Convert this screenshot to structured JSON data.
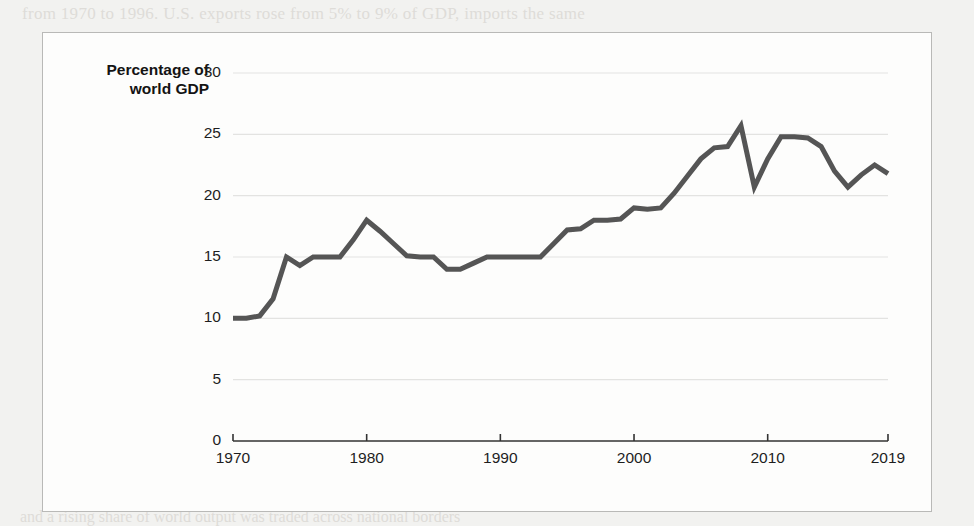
{
  "figure": {
    "background_color": "#fdfdfc",
    "border_color": "#b9b9b7",
    "page_background": "#f2f2f0"
  },
  "bleed_through": {
    "top_line": "from 1970 to 1996. U.S. exports rose from 5% to 9% of GDP, imports the same",
    "bottom_line": "and a rising share of world output was traded across national borders"
  },
  "chart_data": {
    "type": "line",
    "title": "",
    "subtitle": "",
    "xlabel": "",
    "ylabel": "Percentage of world GDP",
    "ylabel_line1": "Percentage of",
    "ylabel_line2": "world GDP",
    "xlim": [
      1970,
      2019
    ],
    "ylim": [
      0,
      30
    ],
    "ytick_values": [
      0,
      5,
      10,
      15,
      20,
      25,
      30
    ],
    "ytick_labels": [
      "0",
      "5",
      "10",
      "15",
      "20",
      "25",
      "30"
    ],
    "xtick_values": [
      1970,
      1980,
      1990,
      2000,
      2010,
      2019
    ],
    "xtick_labels": [
      "1970",
      "1980",
      "1990",
      "2000",
      "2010",
      "2019"
    ],
    "grid": true,
    "grid_axis": "y",
    "grid_color": "#e3e3e1",
    "legend": false,
    "legend_position": "none",
    "line_color": "#555555",
    "line_width": 5,
    "axis_color": "#333333",
    "series": [
      {
        "name": "Trade as percentage of world GDP",
        "x": [
          1970,
          1971,
          1972,
          1973,
          1974,
          1975,
          1976,
          1977,
          1978,
          1979,
          1980,
          1981,
          1982,
          1983,
          1984,
          1985,
          1986,
          1987,
          1988,
          1989,
          1990,
          1991,
          1992,
          1993,
          1994,
          1995,
          1996,
          1997,
          1998,
          1999,
          2000,
          2001,
          2002,
          2003,
          2004,
          2005,
          2006,
          2007,
          2008,
          2009,
          2010,
          2011,
          2012,
          2013,
          2014,
          2015,
          2016,
          2017,
          2018,
          2019
        ],
        "values": [
          10.0,
          10.0,
          10.2,
          11.6,
          15.0,
          14.3,
          15.0,
          15.0,
          15.0,
          16.4,
          18.0,
          17.1,
          16.1,
          15.1,
          15.0,
          15.0,
          14.0,
          14.0,
          14.5,
          15.0,
          15.0,
          15.0,
          15.0,
          15.0,
          16.1,
          17.2,
          17.3,
          18.0,
          18.0,
          18.1,
          19.0,
          18.9,
          19.0,
          20.2,
          21.6,
          23.0,
          23.9,
          24.0,
          25.7,
          20.7,
          23.0,
          24.8,
          24.8,
          24.7,
          24.0,
          22.0,
          20.7,
          21.7,
          22.5,
          21.8
        ]
      }
    ]
  }
}
